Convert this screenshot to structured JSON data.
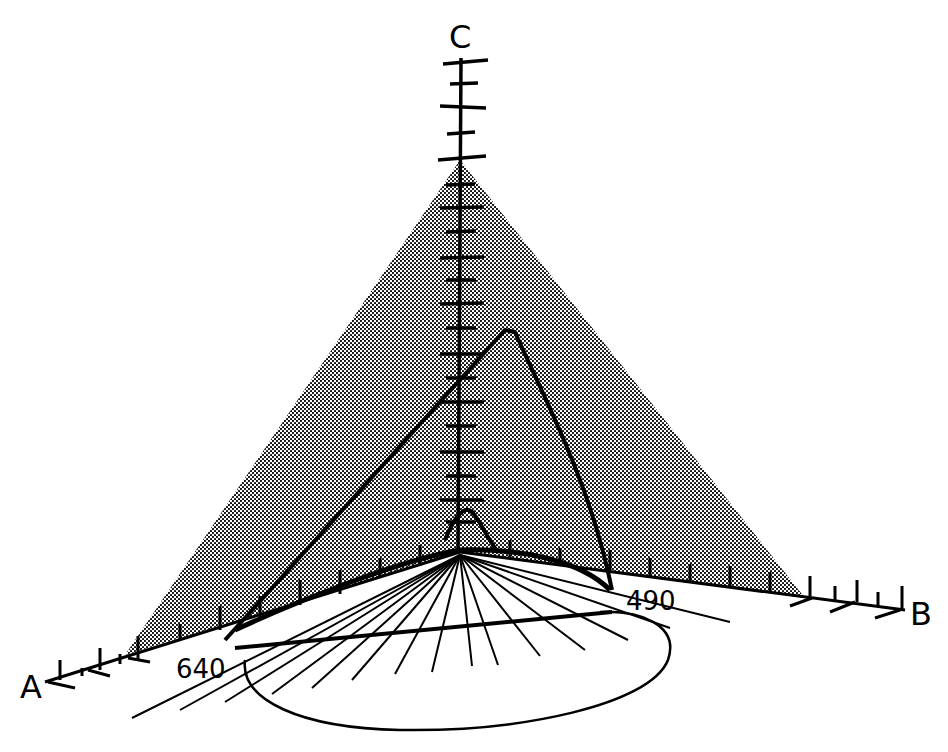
{
  "diagram": {
    "title": "",
    "axes": {
      "a": {
        "label": "A"
      },
      "b": {
        "label": "B"
      },
      "c": {
        "label": "C"
      }
    },
    "annotations": {
      "left_wavelength": "640",
      "right_wavelength": "490"
    },
    "colors": {
      "ink": "#000000",
      "background": "#ffffff",
      "shade": "#9a9a9a"
    },
    "elements": [
      "shaded triangular plane (pyramid face)",
      "vertical C axis with tick marks",
      "A axis with tick marks",
      "B axis with tick marks",
      "large peaked curve",
      "small peaked curve near origin",
      "spectral locus curve on base plane",
      "projection lines from origin",
      "closed loop curve below base"
    ]
  }
}
